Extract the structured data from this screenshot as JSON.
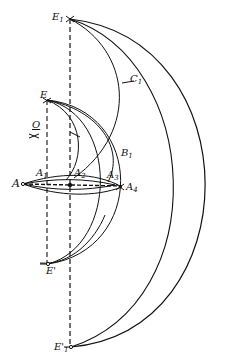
{
  "diagram": {
    "type": "geometric construction",
    "colors": {
      "background": "#ffffff",
      "ink": "#111111"
    },
    "points": [
      {
        "id": "E1",
        "label": "E",
        "sub": "1",
        "x": 70,
        "y": 19
      },
      {
        "id": "C1",
        "label": "C",
        "sub": "1",
        "x": 128,
        "y": 83
      },
      {
        "id": "E",
        "label": "E",
        "sub": "",
        "x": 47,
        "y": 100
      },
      {
        "id": "O",
        "label": "O",
        "sub": "",
        "x": 34,
        "y": 132
      },
      {
        "id": "B1",
        "label": "B",
        "sub": "1",
        "x": 117,
        "y": 145
      },
      {
        "id": "A",
        "label": "A",
        "sub": "",
        "x": 23,
        "y": 184
      },
      {
        "id": "A1",
        "label": "A",
        "sub": "1",
        "x": 44,
        "y": 178
      },
      {
        "id": "A2",
        "label": "A",
        "sub": "2",
        "x": 72,
        "y": 178
      },
      {
        "id": "A3",
        "label": "A",
        "sub": "3",
        "x": 108,
        "y": 180
      },
      {
        "id": "A4",
        "label": "A",
        "sub": "4",
        "x": 122,
        "y": 187
      },
      {
        "id": "E_prime",
        "label": "E'",
        "sub": "",
        "x": 48,
        "y": 264
      },
      {
        "id": "E1_prime",
        "label": "E'",
        "sub": "1",
        "x": 71,
        "y": 347
      }
    ]
  },
  "labels": {
    "E1": "E",
    "E1_sub": "1",
    "C1": "C",
    "C1_sub": "1",
    "E": "E",
    "O": "O",
    "B1": "B",
    "B1_sub": "1",
    "A": "A",
    "A1": "A",
    "A1_sub": "1",
    "A2": "A",
    "A2_sub": "2",
    "A3": "A",
    "A3_sub": "3",
    "A4": "A",
    "A4_sub": "4",
    "E_prime": "E'",
    "E1_prime": "E'",
    "E1_prime_sub": "1"
  }
}
